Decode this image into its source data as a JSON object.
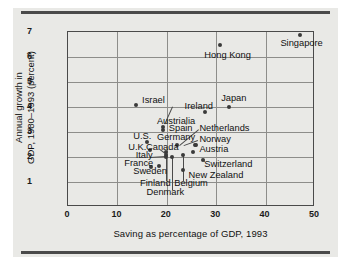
{
  "chart_data": {
    "type": "scatter",
    "title": "",
    "xlabel": "Saving as percentage of GDP, 1993",
    "ylabel_line1": "Annual growth in",
    "ylabel_line2": "GDP, 1980–1993 (percent)",
    "xlim": [
      0,
      50
    ],
    "ylim": [
      0,
      7
    ],
    "xticks": [
      "0",
      "10",
      "20",
      "30",
      "40",
      "50"
    ],
    "xtick_values": [
      0,
      10,
      20,
      30,
      40,
      50
    ],
    "yticks": [
      "1",
      "2",
      "3",
      "4",
      "5",
      "6",
      "7"
    ],
    "ytick_values": [
      1,
      2,
      3,
      4,
      5,
      6,
      7
    ],
    "grid": true,
    "legend": "none",
    "points": [
      {
        "label": "Singapore",
        "x": 47.0,
        "y": 6.9
      },
      {
        "label": "Hong Kong",
        "x": 30.8,
        "y": 6.5
      },
      {
        "label": "Japan",
        "x": 32.6,
        "y": 4.0
      },
      {
        "label": "Israel",
        "x": 13.8,
        "y": 4.1
      },
      {
        "label": "Ireland",
        "x": 27.7,
        "y": 3.8
      },
      {
        "label": "Austrialia",
        "x": 19.2,
        "y": 3.2
      },
      {
        "label": "Spain",
        "x": 19.3,
        "y": 3.1
      },
      {
        "label": "U.S.",
        "x": 15.9,
        "y": 2.6
      },
      {
        "label": "Germany",
        "x": 22.0,
        "y": 2.5
      },
      {
        "label": "Netherlands",
        "x": 25.9,
        "y": 2.5
      },
      {
        "label": "Norway",
        "x": 25.8,
        "y": 2.5
      },
      {
        "label": "Canada",
        "x": 19.9,
        "y": 2.2
      },
      {
        "label": "U.K.",
        "x": 16.6,
        "y": 2.3
      },
      {
        "label": "Austria",
        "x": 25.3,
        "y": 2.2
      },
      {
        "label": "Italy",
        "x": 19.9,
        "y": 2.1
      },
      {
        "label": "Belgium",
        "x": 23.2,
        "y": 2.1
      },
      {
        "label": "Finland",
        "x": 19.8,
        "y": 2.0
      },
      {
        "label": "Denmark",
        "x": 21.1,
        "y": 2.0
      },
      {
        "label": "Switzerland",
        "x": 27.3,
        "y": 1.9
      },
      {
        "label": "France",
        "x": 18.4,
        "y": 1.65
      },
      {
        "label": "Sweden",
        "x": 16.9,
        "y": 1.6
      },
      {
        "label": "New Zealand",
        "x": 23.3,
        "y": 1.5
      }
    ],
    "annotations": [
      {
        "text": "Singapore",
        "anchor_x": 43.0,
        "anchor_y": 6.55,
        "align": "left"
      },
      {
        "text": "Hong Kong",
        "anchor_x": 27.6,
        "anchor_y": 6.1,
        "align": "left"
      },
      {
        "text": "Japan",
        "anchor_x": 31.0,
        "anchor_y": 4.35,
        "align": "left"
      },
      {
        "text": "Israel",
        "anchor_x": 15.0,
        "anchor_y": 4.28,
        "align": "left"
      },
      {
        "text": "Ireland",
        "anchor_x": 23.6,
        "anchor_y": 4.06,
        "align": "left"
      },
      {
        "text": "Austrialia",
        "anchor_x": 18.0,
        "anchor_y": 3.44,
        "align": "left"
      },
      {
        "text": "Spain",
        "anchor_x": 20.4,
        "anchor_y": 3.18,
        "align": "left"
      },
      {
        "text": "Netherlands",
        "anchor_x": 26.6,
        "anchor_y": 3.17,
        "align": "left"
      },
      {
        "text": "U.S.",
        "anchor_x": 13.2,
        "anchor_y": 2.83,
        "align": "left"
      },
      {
        "text": "Germany",
        "anchor_x": 18.0,
        "anchor_y": 2.82,
        "align": "left"
      },
      {
        "text": "Norway",
        "anchor_x": 26.6,
        "anchor_y": 2.74,
        "align": "left"
      },
      {
        "text": "U.K.",
        "anchor_x": 12.2,
        "anchor_y": 2.42,
        "align": "left"
      },
      {
        "text": "Canada",
        "anchor_x": 15.8,
        "anchor_y": 2.42,
        "align": "left"
      },
      {
        "text": "Austria",
        "anchor_x": 26.6,
        "anchor_y": 2.33,
        "align": "left"
      },
      {
        "text": "Italy",
        "anchor_x": 13.7,
        "anchor_y": 2.1,
        "align": "left"
      },
      {
        "text": "France",
        "anchor_x": 11.4,
        "anchor_y": 1.78,
        "align": "left"
      },
      {
        "text": "Switzerland",
        "anchor_x": 27.6,
        "anchor_y": 1.72,
        "align": "left"
      },
      {
        "text": "Sweden",
        "anchor_x": 13.2,
        "anchor_y": 1.46,
        "align": "left"
      },
      {
        "text": "New Zealand",
        "anchor_x": 24.4,
        "anchor_y": 1.27,
        "align": "left"
      },
      {
        "text": "Finland",
        "anchor_x": 14.6,
        "anchor_y": 0.98,
        "align": "left"
      },
      {
        "text": "Belgium",
        "anchor_x": 21.5,
        "anchor_y": 0.98,
        "align": "left"
      },
      {
        "text": "Denmark",
        "anchor_x": 15.9,
        "anchor_y": 0.62,
        "align": "left"
      }
    ],
    "leader_lines": [
      {
        "from_x": 21.2,
        "from_y": 4.0,
        "to_x": 19.6,
        "to_y": 3.3
      },
      {
        "from_x": 26.5,
        "from_y": 3.1,
        "to_x": 22.6,
        "to_y": 2.46
      },
      {
        "from_x": 26.4,
        "from_y": 2.66,
        "to_x": 23.6,
        "to_y": 2.46
      },
      {
        "from_x": 18.6,
        "from_y": 2.34,
        "to_x": 20.1,
        "to_y": 2.12
      },
      {
        "from_x": 16.6,
        "from_y": 2.02,
        "to_x": 19.8,
        "to_y": 2.06
      },
      {
        "from_x": 19.8,
        "from_y": 1.06,
        "to_x": 19.8,
        "to_y": 2.0
      },
      {
        "from_x": 21.1,
        "from_y": 0.7,
        "to_x": 21.1,
        "to_y": 2.0
      },
      {
        "from_x": 23.2,
        "from_y": 1.06,
        "to_x": 23.2,
        "to_y": 2.06
      },
      {
        "from_x": 27.5,
        "from_y": 1.8,
        "to_x": 27.3,
        "to_y": 1.92
      }
    ],
    "colors": {
      "background": "#e9e9e6",
      "dot": "#3a3a3a",
      "grid": "#8d8d8a",
      "frame": "#4a4a4a",
      "text": "#111111"
    }
  }
}
